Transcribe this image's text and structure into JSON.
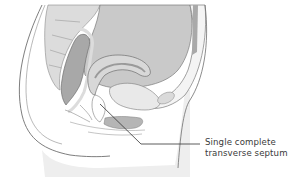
{
  "figure": {
    "colors": {
      "background": "#ffffff",
      "skin": "#ececec",
      "soft_tissue": "#dedede",
      "organ_mid": "#c6c6c6",
      "organ_dark": "#a9a9a9",
      "outline": "#6f6f6f",
      "pale_wall": "#f3f3f3"
    }
  },
  "annotation": {
    "line1": "Single complete",
    "line2": "transverse septum",
    "leader_color": "#333333"
  }
}
